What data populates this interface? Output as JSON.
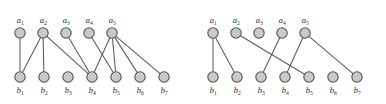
{
  "figure": {
    "title": "",
    "background_color": "#ffffff",
    "width": 386,
    "height": 104,
    "node_fill": "#c9c9c9",
    "node_stroke": "#555555",
    "edge_color": "#5a5a5a",
    "label_color": "#2b2b2b"
  },
  "chart_data": {
    "type": "diagram",
    "diagram_type": "bipartite-graph-pair",
    "title": "",
    "xlabel": "",
    "ylabel": "",
    "graphs": [
      {
        "name": "left-graph",
        "top_nodes": [
          {
            "id": "a1",
            "label": "a",
            "sub": "1",
            "cx": 20,
            "cy": 33
          },
          {
            "id": "a2",
            "label": "a",
            "sub": "2",
            "cx": 43,
            "cy": 33
          },
          {
            "id": "a3",
            "label": "a",
            "sub": "3",
            "cx": 66,
            "cy": 33
          },
          {
            "id": "a4",
            "label": "a",
            "sub": "4",
            "cx": 89,
            "cy": 33
          },
          {
            "id": "a5",
            "label": "a",
            "sub": "5",
            "cx": 112,
            "cy": 33
          }
        ],
        "bottom_nodes": [
          {
            "id": "b1",
            "label": "b",
            "sub": "1",
            "cx": 20,
            "cy": 77
          },
          {
            "id": "b2",
            "label": "b",
            "sub": "2",
            "cx": 44,
            "cy": 77
          },
          {
            "id": "b3",
            "label": "b",
            "sub": "3",
            "cx": 68,
            "cy": 77
          },
          {
            "id": "b4",
            "label": "b",
            "sub": "4",
            "cx": 92,
            "cy": 77
          },
          {
            "id": "b5",
            "label": "b",
            "sub": "5",
            "cx": 116,
            "cy": 77
          },
          {
            "id": "b6",
            "label": "b",
            "sub": "6",
            "cx": 140,
            "cy": 77
          },
          {
            "id": "b7",
            "label": "b",
            "sub": "7",
            "cx": 164,
            "cy": 77
          }
        ],
        "edges": [
          {
            "from": "a1",
            "to": "b1"
          },
          {
            "from": "a2",
            "to": "b1"
          },
          {
            "from": "a2",
            "to": "b2"
          },
          {
            "from": "a2",
            "to": "b4"
          },
          {
            "from": "a3",
            "to": "b4"
          },
          {
            "from": "a4",
            "to": "b5"
          },
          {
            "from": "a5",
            "to": "b4"
          },
          {
            "from": "a5",
            "to": "b5"
          },
          {
            "from": "a5",
            "to": "b6"
          },
          {
            "from": "a5",
            "to": "b7"
          }
        ]
      },
      {
        "name": "right-graph",
        "top_nodes": [
          {
            "id": "a1",
            "label": "a",
            "sub": "1",
            "cx": 213,
            "cy": 33
          },
          {
            "id": "a2",
            "label": "a",
            "sub": "2",
            "cx": 236,
            "cy": 33
          },
          {
            "id": "a3",
            "label": "a",
            "sub": "3",
            "cx": 259,
            "cy": 33
          },
          {
            "id": "a4",
            "label": "a",
            "sub": "4",
            "cx": 282,
            "cy": 33
          },
          {
            "id": "a5",
            "label": "a",
            "sub": "5",
            "cx": 305,
            "cy": 33
          }
        ],
        "bottom_nodes": [
          {
            "id": "b1",
            "label": "b",
            "sub": "1",
            "cx": 213,
            "cy": 77
          },
          {
            "id": "b2",
            "label": "b",
            "sub": "2",
            "cx": 237,
            "cy": 77
          },
          {
            "id": "b3",
            "label": "b",
            "sub": "3",
            "cx": 261,
            "cy": 77
          },
          {
            "id": "b4",
            "label": "b",
            "sub": "4",
            "cx": 285,
            "cy": 77
          },
          {
            "id": "b5",
            "label": "b",
            "sub": "5",
            "cx": 309,
            "cy": 77
          },
          {
            "id": "b6",
            "label": "b",
            "sub": "6",
            "cx": 333,
            "cy": 77
          },
          {
            "id": "b7",
            "label": "b",
            "sub": "7",
            "cx": 357,
            "cy": 77
          }
        ],
        "edges": [
          {
            "from": "a1",
            "to": "b1"
          },
          {
            "from": "a1",
            "to": "b2"
          },
          {
            "from": "a2",
            "to": "b5"
          },
          {
            "from": "a4",
            "to": "b3"
          },
          {
            "from": "a5",
            "to": "b4"
          },
          {
            "from": "a5",
            "to": "b7"
          }
        ]
      }
    ]
  }
}
